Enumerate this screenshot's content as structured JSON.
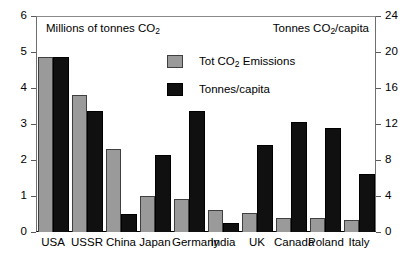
{
  "chart_data": {
    "type": "bar",
    "title": "",
    "categories": [
      "USA",
      "USSR",
      "China",
      "Japan",
      "Germany",
      "India",
      "UK",
      "Canada",
      "Poland",
      "Italy"
    ],
    "series": [
      {
        "name": "Tot CO2 Emissions",
        "axis": "left",
        "color": "#9a9a9a",
        "values": [
          4.85,
          3.8,
          2.3,
          1.0,
          0.93,
          0.6,
          0.52,
          0.4,
          0.39,
          0.33
        ]
      },
      {
        "name": "Tonnes/capita",
        "axis": "right",
        "color": "#101010",
        "values": [
          19.4,
          13.4,
          2.0,
          8.6,
          13.5,
          1.0,
          9.7,
          12.2,
          11.6,
          6.4
        ]
      }
    ],
    "left_axis": {
      "label": "Millions of tonnes CO2",
      "ticks": [
        0,
        1,
        2,
        3,
        4,
        5,
        6
      ],
      "ylim": [
        0,
        6
      ]
    },
    "right_axis": {
      "label": "Tonnes CO2/capita",
      "ticks": [
        0,
        4,
        8,
        12,
        16,
        20,
        24
      ],
      "ylim": [
        0,
        24
      ]
    },
    "xlabel": "",
    "grid": false,
    "legend_position": "top-center"
  },
  "axis_titles": {
    "left_pre": "Millions of tonnes CO",
    "left_sub": "2",
    "left_post": "",
    "right_pre": "Tonnes CO",
    "right_sub": "2",
    "right_post": "/capita"
  },
  "legend": {
    "entries": [
      {
        "pre": "Tot CO",
        "sub": "2",
        "post": " Emissions",
        "swatch": "gray"
      },
      {
        "pre": "Tonnes/capita",
        "sub": "",
        "post": "",
        "swatch": "black"
      }
    ]
  },
  "ticks": {
    "left": [
      "6",
      "5",
      "4",
      "3",
      "2",
      "1",
      "0"
    ],
    "right": [
      "24",
      "20",
      "16",
      "12",
      "8",
      "4",
      "0"
    ]
  }
}
